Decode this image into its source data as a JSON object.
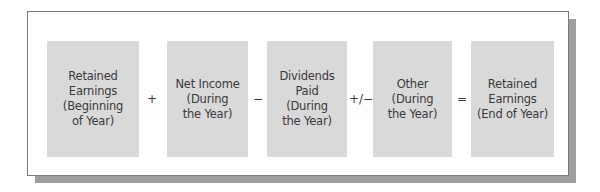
{
  "diagram": {
    "type": "equation-flow",
    "colors": {
      "box_fill": "#d9d9d9",
      "text": "#3a3a3a",
      "frame_border": "#7a7a7a",
      "shadow": "#9e9e9e",
      "background": "#ffffff"
    },
    "terms": [
      {
        "label": "Retained\nEarnings\n(Beginning\nof Year)"
      },
      {
        "label": "Net Income\n(During\nthe Year)"
      },
      {
        "label": "Dividends\nPaid\n(During\nthe Year)"
      },
      {
        "label": "Other\n(During\nthe Year)"
      },
      {
        "label": "Retained\nEarnings\n(End of Year)"
      }
    ],
    "operators": [
      "+",
      "−",
      "+/−",
      "="
    ]
  }
}
